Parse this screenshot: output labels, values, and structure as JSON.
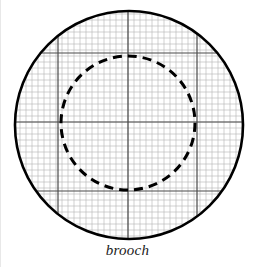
{
  "figure": {
    "caption": "brooch",
    "background_color": "#ffffff",
    "outline_color": "#000000",
    "grid_minor_color": "#b4b4b4",
    "grid_major_color": "#4a4a4a",
    "dashed_color": "#000000"
  },
  "outer_circle": {
    "name": "brooch-outline",
    "center_x": 128,
    "center_y": 125,
    "radius": 114,
    "stroke_width": 2.6,
    "style": "solid"
  },
  "inner_circle": {
    "name": "brooch-inner-ring",
    "center_x": 127,
    "center_y": 123,
    "radius": 67,
    "stroke_width": 3.0,
    "style": "dashed",
    "dash_pattern": "9 6"
  },
  "grid": {
    "minor_spacing": 6,
    "major_spacing": 69.5,
    "minor_stroke_width": 0.6,
    "major_stroke_width": 1.2,
    "major_x_positions": [
      57,
      127,
      196
    ],
    "major_y_positions": [
      53,
      122,
      191
    ]
  }
}
